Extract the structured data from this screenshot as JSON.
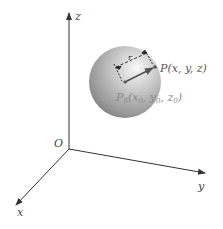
{
  "figure": {
    "axes": {
      "origin_label": "O",
      "x_label": "x",
      "y_label": "y",
      "z_label": "z"
    },
    "sphere": {
      "center_label_main": "P",
      "center_label_sub": "0",
      "center_coords": [
        "x",
        "0",
        ", ",
        "y",
        "0",
        ", ",
        "z",
        "0"
      ],
      "point_label": "P(x, y, z)",
      "radius_label": "r"
    },
    "colors": {
      "axis": "#333333",
      "sphere_light": "#f4f4f4",
      "sphere_mid": "#b8b8b8",
      "sphere_dark": "#7a7a7a",
      "vector": "#555555",
      "label": "#444444",
      "label_faded": "#8a8a8a"
    }
  }
}
